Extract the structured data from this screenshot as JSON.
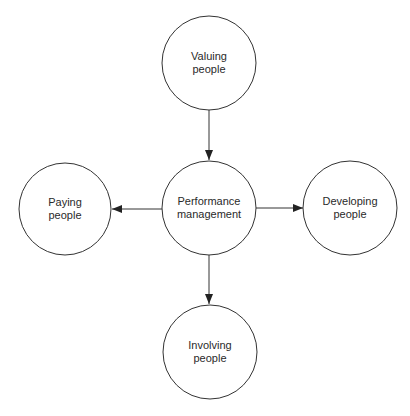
{
  "diagram": {
    "type": "hub-and-spoke",
    "colors": {
      "stroke": "#333333",
      "text": "#2a2a2a",
      "background": "#ffffff"
    },
    "nodes": {
      "center": {
        "line1": "Performance",
        "line2": "management"
      },
      "top": {
        "line1": "Valuing",
        "line2": "people"
      },
      "left": {
        "line1": "Paying",
        "line2": "people"
      },
      "right": {
        "line1": "Developing",
        "line2": "people"
      },
      "bottom": {
        "line1": "Involving",
        "line2": "people"
      }
    },
    "edges": [
      {
        "from": "Valuing people",
        "to": "Performance management"
      },
      {
        "from": "Performance management",
        "to": "Paying people"
      },
      {
        "from": "Performance management",
        "to": "Developing people"
      },
      {
        "from": "Performance management",
        "to": "Involving people"
      }
    ]
  }
}
